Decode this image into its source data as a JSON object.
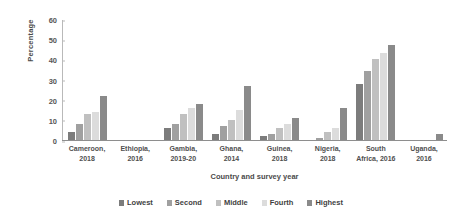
{
  "chart_data": {
    "type": "bar",
    "title": "",
    "xlabel": "Country and survey year",
    "ylabel": "Percentage",
    "ylim": [
      0,
      60
    ],
    "yticks": [
      0,
      10,
      20,
      30,
      40,
      50,
      60
    ],
    "grid": false,
    "legend_position": "bottom",
    "categories": [
      "Cameroon, 2018",
      "Ethiopia, 2016",
      "Gambia, 2019-20",
      "Ghana, 2014",
      "Guinea, 2018",
      "Nigeria, 2018",
      "South Africa, 2016",
      "Uganda, 2016"
    ],
    "category_lines": [
      [
        "Cameroon,",
        "2018"
      ],
      [
        "Ethiopia,",
        "2016"
      ],
      [
        "Gambia,",
        "2019-20"
      ],
      [
        "Ghana,",
        "2014"
      ],
      [
        "Guinea,",
        "2018"
      ],
      [
        "Nigeria,",
        "2018"
      ],
      [
        "South",
        "Africa, 2016"
      ],
      [
        "Uganda,",
        "2016"
      ]
    ],
    "series": [
      {
        "name": "Lowest",
        "color": "#7c7c7c",
        "values": [
          4,
          0,
          6,
          3,
          2,
          0,
          28,
          0
        ]
      },
      {
        "name": "Second",
        "color": "#a0a0a0",
        "values": [
          8,
          0,
          8,
          7,
          3,
          1,
          34,
          0
        ]
      },
      {
        "name": "Middle",
        "color": "#c0c0c0",
        "values": [
          13,
          0,
          13,
          10,
          6,
          4,
          40,
          0
        ]
      },
      {
        "name": "Fourth",
        "color": "#dcdcdc",
        "values": [
          14,
          0,
          16,
          15,
          8,
          6,
          43,
          0
        ]
      },
      {
        "name": "Highest",
        "color": "#8a8a8a",
        "values": [
          22,
          0,
          18,
          27,
          11,
          16,
          47,
          3
        ]
      }
    ]
  },
  "legend": {
    "items": [
      {
        "label": "Lowest"
      },
      {
        "label": "Second"
      },
      {
        "label": "Middle"
      },
      {
        "label": "Fourth"
      },
      {
        "label": "Highest"
      }
    ]
  }
}
